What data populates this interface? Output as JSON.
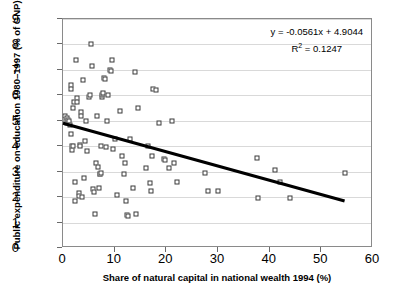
{
  "chart_data": {
    "type": "scatter",
    "title": "",
    "xlabel": "Share of natural capital in national wealth 1994 (%)",
    "ylabel": "Public expenditure on education 1980–1997 (% of GNP)",
    "xlim": [
      0,
      60
    ],
    "ylim": [
      0,
      9
    ],
    "xticks": [
      0,
      10,
      20,
      30,
      40,
      50,
      60
    ],
    "yticks": [
      0,
      1,
      2,
      3,
      4,
      5,
      6,
      7,
      8,
      9
    ],
    "grid": "horizontal",
    "legend": "none",
    "marker": "open-square",
    "annotations": {
      "equation": "y = -0.0561x + 4.9044",
      "r_squared_label": "R",
      "r_squared_sup": "2",
      "r_squared_value": "= 0.1247"
    },
    "trendline": {
      "type": "linear",
      "slope": -0.0561,
      "intercept": 4.9044,
      "r_squared": 0.1247,
      "x_start": 0,
      "x_end": 54.5,
      "color": "#000000"
    },
    "points": [
      [
        0.4,
        5.2
      ],
      [
        0.6,
        5.0
      ],
      [
        0.7,
        4.9
      ],
      [
        0.8,
        5.1
      ],
      [
        0.9,
        4.95
      ],
      [
        1.0,
        5.05
      ],
      [
        1.1,
        4.9
      ],
      [
        1.2,
        5.0
      ],
      [
        1.3,
        4.85
      ],
      [
        1.5,
        6.4
      ],
      [
        1.5,
        6.25
      ],
      [
        1.6,
        4.5
      ],
      [
        1.7,
        4.0
      ],
      [
        1.8,
        3.85
      ],
      [
        1.9,
        4.0
      ],
      [
        2.0,
        5.5
      ],
      [
        2.2,
        5.75
      ],
      [
        2.3,
        2.6
      ],
      [
        2.4,
        1.85
      ],
      [
        2.6,
        7.4
      ],
      [
        2.7,
        5.9
      ],
      [
        2.8,
        5.75
      ],
      [
        3.0,
        2.15
      ],
      [
        3.1,
        2.05
      ],
      [
        3.2,
        4.05
      ],
      [
        3.3,
        4.0
      ],
      [
        3.4,
        5.35
      ],
      [
        3.5,
        5.2
      ],
      [
        3.6,
        2.0
      ],
      [
        3.8,
        6.6
      ],
      [
        4.0,
        2.75
      ],
      [
        4.2,
        4.2
      ],
      [
        4.4,
        5.0
      ],
      [
        4.6,
        3.8
      ],
      [
        5.0,
        5.95
      ],
      [
        5.2,
        6.0
      ],
      [
        5.4,
        8.0
      ],
      [
        5.6,
        7.15
      ],
      [
        5.8,
        2.3
      ],
      [
        6.0,
        2.2
      ],
      [
        6.2,
        1.35
      ],
      [
        6.4,
        3.35
      ],
      [
        6.6,
        5.2
      ],
      [
        6.8,
        3.2
      ],
      [
        7.0,
        2.35
      ],
      [
        7.1,
        2.9
      ],
      [
        7.2,
        2.9
      ],
      [
        7.3,
        2.95
      ],
      [
        7.4,
        4.0
      ],
      [
        7.5,
        5.95
      ],
      [
        7.6,
        6.0
      ],
      [
        7.7,
        6.05
      ],
      [
        7.8,
        6.1
      ],
      [
        8.0,
        6.7
      ],
      [
        8.2,
        6.65
      ],
      [
        8.4,
        3.95
      ],
      [
        8.6,
        5.0
      ],
      [
        8.8,
        6.0
      ],
      [
        9.0,
        7.0
      ],
      [
        9.2,
        6.95
      ],
      [
        9.4,
        7.4
      ],
      [
        9.6,
        3.9
      ],
      [
        10.0,
        4.3
      ],
      [
        10.5,
        2.1
      ],
      [
        11.0,
        5.4
      ],
      [
        11.5,
        3.6
      ],
      [
        11.8,
        2.9
      ],
      [
        12.0,
        3.35
      ],
      [
        12.2,
        1.85
      ],
      [
        12.4,
        1.3
      ],
      [
        12.6,
        1.25
      ],
      [
        13.0,
        4.3
      ],
      [
        13.5,
        2.35
      ],
      [
        14.0,
        6.9
      ],
      [
        14.2,
        1.35
      ],
      [
        14.5,
        5.5
      ],
      [
        16.0,
        3.15
      ],
      [
        16.5,
        4.0
      ],
      [
        16.8,
        2.55
      ],
      [
        17.0,
        2.25
      ],
      [
        17.2,
        3.6
      ],
      [
        17.5,
        6.25
      ],
      [
        18.0,
        6.2
      ],
      [
        18.5,
        4.9
      ],
      [
        19.5,
        3.5
      ],
      [
        19.8,
        3.45
      ],
      [
        20.5,
        3.15
      ],
      [
        21.0,
        5.0
      ],
      [
        21.5,
        3.35
      ],
      [
        22.0,
        2.6
      ],
      [
        27.5,
        2.95
      ],
      [
        28.0,
        2.25
      ],
      [
        30.0,
        2.25
      ],
      [
        37.5,
        3.55
      ],
      [
        37.8,
        1.95
      ],
      [
        41.0,
        3.05
      ],
      [
        42.0,
        2.6
      ],
      [
        44.0,
        1.95
      ],
      [
        54.5,
        2.95
      ]
    ]
  }
}
